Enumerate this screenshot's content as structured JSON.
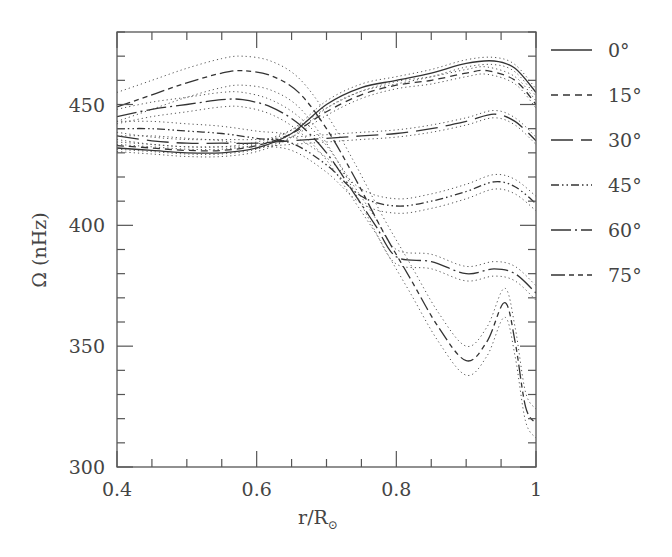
{
  "chart_data": {
    "type": "line",
    "title": "",
    "xlabel": "r/R⊙",
    "ylabel": "Ω (nHz)",
    "xlim": [
      0.4,
      1.0
    ],
    "ylim": [
      300,
      480
    ],
    "x_ticks": [
      0.4,
      0.6,
      0.8,
      1.0
    ],
    "x_tick_labels": [
      "0.4",
      "0.6",
      "0.8",
      "1"
    ],
    "x_minor_step": 0.05,
    "y_ticks": [
      300,
      350,
      400,
      450
    ],
    "y_tick_labels": [
      "300",
      "350",
      "400",
      "450"
    ],
    "y_minor_step": 10,
    "grid": false,
    "legend_position": "right-outside",
    "series": [
      {
        "name": "0°",
        "style": "solid",
        "x": [
          0.4,
          0.45,
          0.5,
          0.55,
          0.6,
          0.65,
          0.7,
          0.75,
          0.8,
          0.85,
          0.9,
          0.94,
          0.97,
          1.0
        ],
        "y": [
          432,
          431,
          430,
          430,
          432,
          438,
          450,
          457,
          460,
          463,
          467,
          468,
          465,
          455
        ],
        "err": 1.5
      },
      {
        "name": "15°",
        "style": "short-dash",
        "x": [
          0.4,
          0.45,
          0.5,
          0.55,
          0.6,
          0.65,
          0.7,
          0.75,
          0.8,
          0.85,
          0.9,
          0.93,
          0.97,
          1.0
        ],
        "y": [
          433,
          432,
          431,
          431,
          433,
          438,
          447,
          454,
          458,
          460,
          463,
          464,
          460,
          450
        ],
        "err": 1.5
      },
      {
        "name": "30°",
        "style": "long-dash",
        "x": [
          0.4,
          0.45,
          0.5,
          0.55,
          0.6,
          0.65,
          0.7,
          0.75,
          0.8,
          0.85,
          0.9,
          0.94,
          0.97,
          1.0
        ],
        "y": [
          437,
          435,
          434,
          434,
          434,
          435,
          436,
          437,
          438,
          440,
          443,
          446,
          443,
          435
        ],
        "err": 1.5
      },
      {
        "name": "45°",
        "style": "dash-dot-dot",
        "x": [
          0.4,
          0.45,
          0.5,
          0.55,
          0.6,
          0.65,
          0.7,
          0.75,
          0.8,
          0.85,
          0.9,
          0.94,
          0.97,
          1.0
        ],
        "y": [
          440,
          440,
          439,
          438,
          436,
          434,
          425,
          412,
          408,
          410,
          414,
          418,
          416,
          409
        ],
        "err": 3
      },
      {
        "name": "60°",
        "style": "long-dash-dot",
        "x": [
          0.4,
          0.45,
          0.5,
          0.55,
          0.58,
          0.62,
          0.66,
          0.7,
          0.74,
          0.77,
          0.8,
          0.85,
          0.9,
          0.94,
          0.97,
          1.0
        ],
        "y": [
          445,
          448,
          450,
          452,
          452,
          449,
          442,
          430,
          413,
          400,
          387,
          385,
          380,
          382,
          380,
          372
        ],
        "err": 3
      },
      {
        "name": "75°",
        "style": "long-short-short",
        "x": [
          0.4,
          0.45,
          0.5,
          0.55,
          0.58,
          0.62,
          0.66,
          0.7,
          0.74,
          0.78,
          0.82,
          0.86,
          0.9,
          0.93,
          0.955,
          0.97,
          0.985,
          1.0
        ],
        "y": [
          449,
          454,
          459,
          463,
          464,
          462,
          455,
          440,
          420,
          398,
          378,
          358,
          344,
          352,
          368,
          352,
          325,
          318
        ],
        "err": 6
      }
    ]
  },
  "legend": {
    "items": [
      {
        "label": "0°",
        "dash": ""
      },
      {
        "label": "15°",
        "dash": "7,5"
      },
      {
        "label": "30°",
        "dash": "22,8"
      },
      {
        "label": "45°",
        "dash": "8,3,1.5,3,1.5,3"
      },
      {
        "label": "60°",
        "dash": "20,4,2,4"
      },
      {
        "label": "75°",
        "dash": "14,4,5,4,5,4"
      }
    ]
  },
  "axes": {
    "xlabel_main": "r/R",
    "xlabel_sub": "⊙",
    "ylabel": "Ω (nHz)"
  }
}
